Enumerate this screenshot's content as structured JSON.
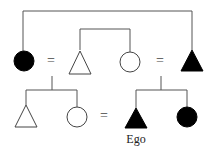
{
  "diagram": {
    "type": "kinship-chart",
    "generations": [
      {
        "level": 1,
        "members": [
          {
            "id": "fz",
            "shape": "circle",
            "sex": "female",
            "filled": true
          },
          {
            "id": "f",
            "shape": "triangle",
            "sex": "male",
            "filled": false
          },
          {
            "id": "m",
            "shape": "circle",
            "sex": "female",
            "filled": false
          },
          {
            "id": "mb",
            "shape": "triangle",
            "sex": "male",
            "filled": true
          }
        ],
        "marriages": [
          [
            "fz",
            "f"
          ],
          [
            "m",
            "mb"
          ]
        ],
        "sibling_sets": [
          [
            "f",
            "m"
          ],
          [
            "fz",
            "mb"
          ]
        ]
      },
      {
        "level": 2,
        "members": [
          {
            "id": "b",
            "shape": "triangle",
            "sex": "male",
            "filled": false
          },
          {
            "id": "z",
            "shape": "circle",
            "sex": "female",
            "filled": false
          },
          {
            "id": "ego",
            "shape": "triangle",
            "sex": "male",
            "filled": true,
            "label": "Ego"
          },
          {
            "id": "sz",
            "shape": "circle",
            "sex": "female",
            "filled": true
          }
        ],
        "marriages": [
          [
            "z",
            "ego"
          ]
        ]
      }
    ],
    "marriage_symbol": "=",
    "ego_label": "Ego"
  }
}
